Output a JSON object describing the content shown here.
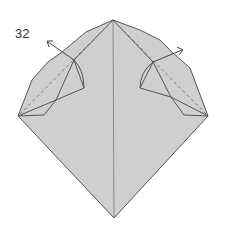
{
  "diagram": {
    "step_number": "32",
    "colors": {
      "paper": "#cfcfcf",
      "line": "#555555",
      "dash": "#777777",
      "arrow": "#444444",
      "background": "#ffffff"
    },
    "symbols": [
      "valley-fold-dashed-line-left",
      "valley-fold-dashed-line-right",
      "fold-arrow-left",
      "fold-arrow-right"
    ]
  }
}
